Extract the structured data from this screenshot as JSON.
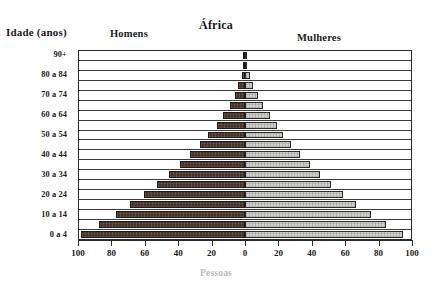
{
  "header": {
    "axis_title": "Idade (anos)",
    "left_legend": "Homens",
    "title": "África",
    "right_legend": "Mulheres"
  },
  "footer": {
    "x_title": "Pessoas"
  },
  "colors": {
    "male": "#463129",
    "female": "#cfcfcb",
    "frame": "#2b2b2b",
    "text": "#1a1a1a"
  },
  "axis": {
    "x_ticks": [
      "100",
      "80",
      "60",
      "40",
      "20",
      "0",
      "20",
      "40",
      "60",
      "80",
      "100"
    ],
    "x_tick_values": [
      -100,
      -80,
      -60,
      -40,
      -20,
      0,
      20,
      40,
      60,
      80,
      100
    ],
    "x_min": -100,
    "x_max": 100,
    "y_tick_labels": [
      "0 a 4",
      "10 a 14",
      "20 a 24",
      "30 a 34",
      "40 a 44",
      "50 a 54",
      "60 a 64",
      "70 a 74",
      "80 a 84",
      "90+"
    ]
  },
  "chart_data": {
    "type": "bar",
    "subtype": "population-pyramid",
    "title": "África",
    "xlabel": "Pessoas",
    "ylabel": "Idade (anos)",
    "xlim": [
      -100,
      100
    ],
    "grid": true,
    "legend": [
      "Homens",
      "Mulheres"
    ],
    "legend_position": "top",
    "categories": [
      "0 a 4",
      "5 a 9",
      "10 a 14",
      "15 a 19",
      "20 a 24",
      "25 a 29",
      "30 a 34",
      "35 a 39",
      "40 a 44",
      "45 a 49",
      "50 a 54",
      "55 a 59",
      "60 a 64",
      "65 a 69",
      "70 a 74",
      "75 a 79",
      "80 a 84",
      "85 a 89",
      "90+"
    ],
    "series": [
      {
        "name": "Homens",
        "side": "left",
        "values": [
          99,
          88,
          78,
          69,
          61,
          53,
          46,
          39,
          33,
          27,
          22,
          17,
          13,
          9,
          6,
          4,
          2,
          1,
          0.6
        ]
      },
      {
        "name": "Mulheres",
        "side": "right",
        "values": [
          95,
          85,
          76,
          67,
          59,
          52,
          45,
          39,
          33,
          28,
          23,
          19,
          15,
          11,
          8,
          5,
          3,
          1,
          0.6
        ]
      }
    ]
  }
}
